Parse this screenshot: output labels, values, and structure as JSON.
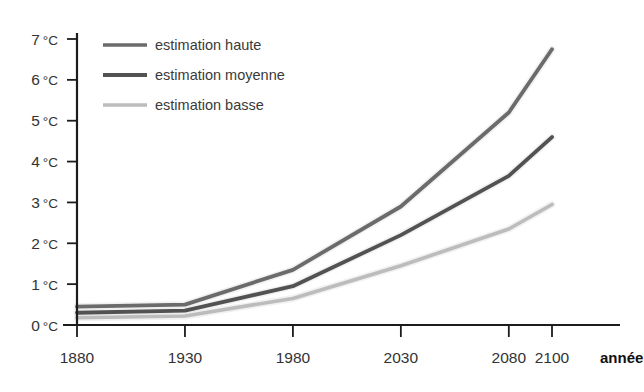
{
  "chart_data": {
    "type": "line",
    "title": "",
    "subtitle": "",
    "xlabel": "année",
    "ylabel": "",
    "grid": false,
    "legend_position": "top-left",
    "x": [
      1880,
      1930,
      1980,
      2030,
      2080,
      2100
    ],
    "x_tick_labels": [
      "1880",
      "1930",
      "1980",
      "2030",
      "2080",
      "2100"
    ],
    "xlim": [
      1880,
      2100
    ],
    "ylim": [
      0,
      7
    ],
    "y_tick_values": [
      0,
      1,
      2,
      3,
      4,
      5,
      6,
      7
    ],
    "y_tick_labels": [
      "0 °C",
      "1 °C",
      "2 °C",
      "3 °C",
      "4 °C",
      "5 °C",
      "6 °C",
      "7 °C"
    ],
    "y_unit": "°C",
    "series": [
      {
        "name": "estimation haute",
        "color": "#6b6b6b",
        "values": [
          0.45,
          0.5,
          1.35,
          2.9,
          5.2,
          6.75
        ]
      },
      {
        "name": "estimation moyenne",
        "color": "#525252",
        "values": [
          0.3,
          0.35,
          0.95,
          2.2,
          3.65,
          4.6
        ]
      },
      {
        "name": "estimation basse",
        "color": "#bcbcbc",
        "values": [
          0.18,
          0.22,
          0.65,
          1.45,
          2.35,
          2.95
        ]
      }
    ]
  },
  "axes": {
    "y_ticks": [
      {
        "label_value": "7",
        "label_unit": "°C",
        "value": 7
      },
      {
        "label_value": "6",
        "label_unit": "°C",
        "value": 6
      },
      {
        "label_value": "5",
        "label_unit": "°C",
        "value": 5
      },
      {
        "label_value": "4",
        "label_unit": "°C",
        "value": 4
      },
      {
        "label_value": "3",
        "label_unit": "°C",
        "value": 3
      },
      {
        "label_value": "2",
        "label_unit": "°C",
        "value": 2
      },
      {
        "label_value": "1",
        "label_unit": "°C",
        "value": 1
      },
      {
        "label_value": "0",
        "label_unit": "°C",
        "value": 0
      }
    ],
    "x_ticks": [
      {
        "label": "1880",
        "value": 1880
      },
      {
        "label": "1930",
        "value": 1930
      },
      {
        "label": "1980",
        "value": 1980
      },
      {
        "label": "2030",
        "value": 2030
      },
      {
        "label": "2080",
        "value": 2080
      },
      {
        "label": "2100",
        "value": 2100
      }
    ],
    "x_axis_title": "année"
  },
  "legend": {
    "items": [
      {
        "label": "estimation haute",
        "color": "#6b6b6b",
        "width": 3.6
      },
      {
        "label": "estimation moyenne",
        "color": "#525252",
        "width": 4.2
      },
      {
        "label": "estimation basse",
        "color": "#bcbcbc",
        "width": 3.4
      }
    ]
  },
  "colors": {
    "background": "#ffffff",
    "axis": "#1c1c1c",
    "tick_text": "#333333",
    "haute": "#6b6b6b",
    "moyenne": "#525252",
    "basse": "#bcbcbc"
  }
}
